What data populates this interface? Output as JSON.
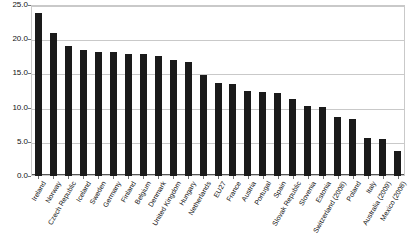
{
  "chart_data": {
    "type": "bar",
    "title": "",
    "subtitle": "",
    "xlabel": "",
    "ylabel": "",
    "ylim": [
      0.0,
      25.0
    ],
    "ytick_labels": [
      "25.0",
      "20.0",
      "15.0",
      "10.0",
      "5.0",
      "0.0"
    ],
    "ytick_values": [
      25.0,
      20.0,
      15.0,
      10.0,
      5.0,
      0.0
    ],
    "grid": true,
    "legend": "none",
    "bar_color": "#1a1a1a",
    "grid_color": "#c9c9c9",
    "categories": [
      "Ireland",
      "Norway",
      "Czech Republic",
      "Iceland",
      "Sweden",
      "Germany",
      "Finland",
      "Belgium",
      "Denmark",
      "United Kingdom",
      "Hungary",
      "Netherlands",
      "EU27",
      "France",
      "Austria",
      "Portugal",
      "Spain",
      "Slovak Republic",
      "Slovenia",
      "Estonia",
      "Switzerland (2008)",
      "Poland",
      "Italy",
      "Australia (2009)",
      "Mexico (2008)"
    ],
    "values": [
      23.8,
      20.9,
      19.0,
      18.4,
      18.1,
      18.1,
      17.8,
      17.8,
      17.5,
      17.0,
      16.7,
      14.7,
      13.6,
      13.4,
      12.5,
      12.3,
      12.2,
      11.3,
      10.2,
      10.1,
      8.6,
      8.4,
      5.6,
      5.4,
      3.7
    ]
  },
  "axes": {
    "y_title": "",
    "x_title": ""
  }
}
